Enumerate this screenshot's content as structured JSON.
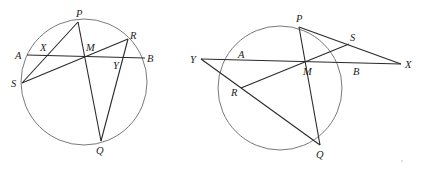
{
  "figures": [
    {
      "id": "left",
      "circle": {
        "cx": 84,
        "cy": 82,
        "r": 63
      },
      "points": {
        "P": [
          78,
          22
        ],
        "Q": [
          101,
          141
        ],
        "R": [
          128,
          39
        ],
        "S": [
          22,
          83
        ],
        "A": [
          27,
          55
        ],
        "B": [
          145,
          58
        ],
        "M": [
          86,
          56
        ],
        "X": [
          46,
          55
        ],
        "Y": [
          122,
          58
        ]
      },
      "segments": [
        [
          "A",
          "B"
        ],
        [
          "P",
          "Q"
        ],
        [
          "R",
          "S"
        ],
        [
          "P",
          "S"
        ],
        [
          "R",
          "Q"
        ]
      ],
      "labels": [
        {
          "text": "P",
          "x": 76,
          "y": 17
        },
        {
          "text": "A",
          "x": 15,
          "y": 59
        },
        {
          "text": "X",
          "x": 40,
          "y": 51
        },
        {
          "text": "M",
          "x": 86,
          "y": 51
        },
        {
          "text": "R",
          "x": 130,
          "y": 39
        },
        {
          "text": "B",
          "x": 147,
          "y": 62
        },
        {
          "text": "Y",
          "x": 113,
          "y": 69
        },
        {
          "text": "S",
          "x": 11,
          "y": 87
        },
        {
          "text": "Q",
          "x": 96,
          "y": 154
        }
      ]
    },
    {
      "id": "right",
      "circle": {
        "cx": 280,
        "cy": 88,
        "r": 62
      },
      "points": {
        "P": [
          299,
          27
        ],
        "Q": [
          320,
          145
        ],
        "R": [
          241,
          88
        ],
        "S": [
          349,
          44
        ],
        "A": [
          246,
          61
        ],
        "B": [
          359,
          62
        ],
        "M": [
          305,
          62
        ],
        "X": [
          401,
          64
        ],
        "Y": [
          201,
          59
        ]
      },
      "segments": [
        [
          "Y",
          "X"
        ],
        [
          "P",
          "Q"
        ],
        [
          "R",
          "S"
        ],
        [
          "P",
          "X"
        ],
        [
          "Y",
          "Q"
        ]
      ],
      "labels": [
        {
          "text": "P",
          "x": 296,
          "y": 22
        },
        {
          "text": "S",
          "x": 350,
          "y": 41
        },
        {
          "text": "Y",
          "x": 190,
          "y": 63
        },
        {
          "text": "A",
          "x": 238,
          "y": 58
        },
        {
          "text": "M",
          "x": 303,
          "y": 75
        },
        {
          "text": "B",
          "x": 353,
          "y": 75
        },
        {
          "text": "X",
          "x": 405,
          "y": 68
        },
        {
          "text": "R",
          "x": 231,
          "y": 96
        },
        {
          "text": "Q",
          "x": 316,
          "y": 158
        }
      ]
    }
  ],
  "artifacts": [
    {
      "x": 402,
      "y": 161
    }
  ]
}
